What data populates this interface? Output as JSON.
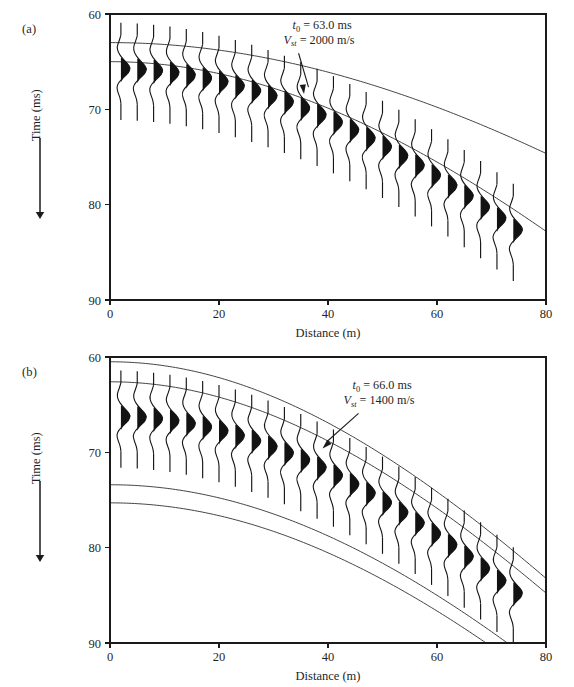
{
  "figure": {
    "panels": [
      {
        "id": "a",
        "label": "(a)",
        "annotation": {
          "t0_symbol": "t",
          "t0_subscript": "0",
          "t0_text": " = 63.0 ms",
          "v_symbol": "V",
          "v_subscript": "st",
          "v_text": " = 2000 m/s"
        },
        "xlabel": "Distance (m)",
        "ylabel": "Time (ms)",
        "xticks": [
          "0",
          "20",
          "40",
          "60",
          "80"
        ],
        "yticks": [
          "60",
          "70",
          "80",
          "90"
        ]
      },
      {
        "id": "b",
        "label": "(b)",
        "annotation": {
          "t0_symbol": "t",
          "t0_subscript": "0",
          "t0_text": " = 66.0 ms",
          "v_symbol": "V",
          "v_subscript": "st",
          "v_text": " = 1400 m/s"
        },
        "xlabel": "Distance (m)",
        "ylabel": "Time (ms)",
        "xticks": [
          "0",
          "20",
          "40",
          "60",
          "80"
        ],
        "yticks": [
          "60",
          "70",
          "80",
          "90"
        ]
      }
    ]
  },
  "chart_data": [
    {
      "type": "line",
      "panel": "a",
      "title": "",
      "xlabel": "Distance (m)",
      "ylabel": "Time (ms)",
      "xlim": [
        0,
        80
      ],
      "ylim": [
        60,
        90
      ],
      "y_inverted": true,
      "xticks": [
        0,
        20,
        40,
        60,
        80
      ],
      "yticks": [
        60,
        70,
        80,
        90
      ],
      "grid": false,
      "legend": "none",
      "annotations": [
        {
          "text": "t0 = 63.0 ms",
          "x": 40,
          "y": 62.2
        },
        {
          "text": "Vst = 2000 m/s",
          "x": 40,
          "y": 63.6
        },
        {
          "text": "arrow from annotation to hyperbola at x=36, y=68.5"
        }
      ],
      "series": [
        {
          "name": "hyperbola-upper",
          "t0": 63.0,
          "v": 2000,
          "formula": "t = sqrt(t0^2 + (x/v*1000)^2)",
          "x": [
            0,
            10,
            20,
            30,
            40,
            50,
            60,
            70,
            77
          ],
          "values": [
            63.0,
            63.2,
            63.8,
            64.7,
            66.0,
            67.6,
            69.4,
            71.4,
            73.0
          ]
        },
        {
          "name": "hyperbola-lower",
          "t0": 65.0,
          "v": 1560,
          "formula": "t = sqrt(t0^2 + (x/v*1000)^2)",
          "x": [
            0,
            10,
            20,
            30,
            40,
            50,
            60,
            70,
            78
          ],
          "values": [
            65.0,
            65.3,
            66.2,
            67.6,
            69.6,
            72.0,
            74.7,
            77.8,
            80.5
          ]
        }
      ],
      "traces": {
        "count": 25,
        "x_start": 2.0,
        "x_spacing": 3.0,
        "description": "seismic wiggle traces, black-filled positive lobe, arrival time follows hyperbola t0=65.5 v=1480",
        "arrival_t0": 65.5,
        "arrival_v": 1480
      }
    },
    {
      "type": "line",
      "panel": "b",
      "title": "",
      "xlabel": "Distance (m)",
      "ylabel": "Time (ms)",
      "xlim": [
        0,
        80
      ],
      "ylim": [
        60,
        90
      ],
      "y_inverted": true,
      "xticks": [
        0,
        20,
        40,
        60,
        80
      ],
      "yticks": [
        60,
        70,
        80,
        90
      ],
      "grid": false,
      "legend": "none",
      "annotations": [
        {
          "text": "t0 = 66.0 ms",
          "x": 47,
          "y": 64.0
        },
        {
          "text": "Vst = 1400 m/s",
          "x": 47,
          "y": 65.4
        },
        {
          "text": "arrow from annotation to trace tops at x=40, y=69.5"
        }
      ],
      "series": [
        {
          "name": "hyperbola-1",
          "t0": 60.5,
          "v": 1400,
          "formula": "t = sqrt(t0^2 + (x/v*1000)^2)",
          "x": [
            0,
            10,
            20,
            30,
            40,
            50,
            60,
            70,
            80
          ],
          "values": [
            60.5,
            61.0,
            62.4,
            64.7,
            67.7,
            71.4,
            75.5,
            80.0,
            84.8
          ]
        },
        {
          "name": "hyperbola-2",
          "t0": 62.6,
          "v": 1400,
          "formula": "t = sqrt(t0^2 + (x/v*1000)^2)",
          "x": [
            0,
            10,
            20,
            30,
            40,
            50,
            60,
            70,
            80
          ],
          "values": [
            62.6,
            63.1,
            64.4,
            66.6,
            69.5,
            73.0,
            77.0,
            81.4,
            86.1
          ]
        },
        {
          "name": "hyperbola-3",
          "t0": 73.4,
          "v": 1400,
          "formula": "t = sqrt(t0^2 + (x/v*1000)^2)",
          "x": [
            0,
            10,
            20,
            30,
            40,
            50,
            60,
            70,
            74
          ],
          "values": [
            73.4,
            73.8,
            74.9,
            76.7,
            79.1,
            82.1,
            85.5,
            89.2,
            90.0
          ]
        },
        {
          "name": "hyperbola-4",
          "t0": 75.3,
          "v": 1400,
          "formula": "t = sqrt(t0^2 + (x/v*1000)^2)",
          "x": [
            0,
            10,
            20,
            30,
            40,
            50,
            60,
            68
          ],
          "values": [
            75.3,
            75.7,
            76.8,
            78.5,
            80.9,
            83.8,
            87.1,
            90.0
          ]
        }
      ],
      "traces": {
        "count": 25,
        "x_start": 2.0,
        "x_spacing": 3.0,
        "description": "seismic wiggle traces, black-filled positive lobe, arrival time follows hyperbola t0=66.0 v=1400",
        "arrival_t0": 66.0,
        "arrival_v": 1400
      }
    }
  ],
  "colors": {
    "ink": "#1a1a1a",
    "curve": "#3a3a3a",
    "fill": "#121212",
    "background": "#ffffff"
  }
}
